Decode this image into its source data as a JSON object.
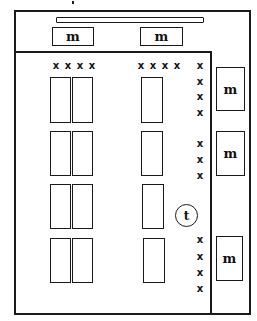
{
  "diagram": {
    "labels": {
      "machine": "m",
      "terminal": "t",
      "marker": "x"
    },
    "top_machines": [
      {
        "label": "m",
        "x": 52,
        "y": 27,
        "w": 42,
        "h": 19
      },
      {
        "label": "m",
        "x": 140,
        "y": 27,
        "w": 43,
        "h": 19
      }
    ],
    "side_machines": [
      {
        "label": "m",
        "x": 216,
        "y": 67,
        "w": 29,
        "h": 44
      },
      {
        "label": "m",
        "x": 216,
        "y": 131,
        "w": 29,
        "h": 45
      },
      {
        "label": "m",
        "x": 216,
        "y": 236,
        "w": 27,
        "h": 45
      }
    ],
    "terminal": {
      "label": "t",
      "cx": 186,
      "cy": 215,
      "r": 11
    },
    "marker_groups": [
      {
        "name": "top-left",
        "items": [
          "x",
          "x",
          "x",
          "x"
        ]
      },
      {
        "name": "top-middle",
        "items": [
          "x",
          "x",
          "x",
          "x"
        ]
      },
      {
        "name": "right-upper",
        "items": [
          "x",
          "x",
          "x",
          "x"
        ]
      },
      {
        "name": "right-middle",
        "items": [
          "x",
          "x",
          "x"
        ]
      },
      {
        "name": "right-lower",
        "items": [
          "x",
          "x",
          "x",
          "x"
        ]
      }
    ],
    "slot_rows": 4
  }
}
